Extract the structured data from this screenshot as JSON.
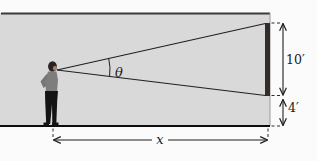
{
  "figure": {
    "labels": {
      "angle": "θ",
      "distance": "x",
      "screen_height": "10′",
      "floor_offset": "4′"
    },
    "colors": {
      "background": "#fbfbfb",
      "room_fill": "#d9d9d9",
      "screen_bar": "#332c28",
      "line": "#1f1f1f"
    }
  }
}
